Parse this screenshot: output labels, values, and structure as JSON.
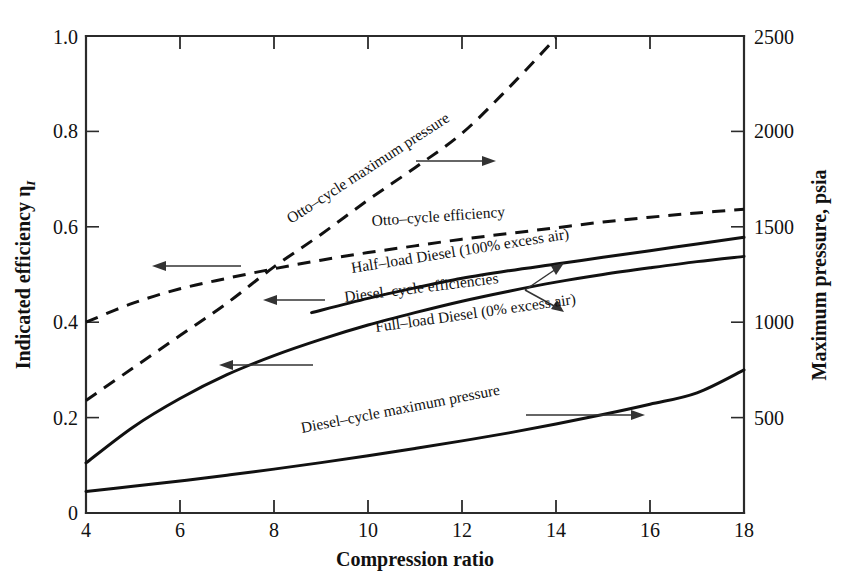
{
  "chart_data": {
    "type": "line",
    "title": "",
    "xlabel": "Compression ratio",
    "ylabel": "Indicated efficiency  η",
    "ylabel_sub": "I",
    "y2label": "Maximum pressure, psia",
    "xlim": [
      4,
      18
    ],
    "ylim": [
      0,
      1.0
    ],
    "y2lim": [
      0,
      2500
    ],
    "xticks": [
      "4",
      "6",
      "8",
      "10",
      "12",
      "14",
      "16",
      "18"
    ],
    "xtick_values": [
      4,
      6,
      8,
      10,
      12,
      14,
      16,
      18
    ],
    "yticks": [
      "0",
      "0.2",
      "0.4",
      "0.6",
      "0.8",
      "1.0"
    ],
    "ytick_values": [
      0,
      0.2,
      0.4,
      0.6,
      0.8,
      1.0
    ],
    "y2ticks": [
      "500",
      "1000",
      "1500",
      "2000",
      "2500"
    ],
    "y2tick_values": [
      500,
      1000,
      1500,
      2000,
      2500
    ],
    "grid": false,
    "legend": "inline-annotations",
    "series": [
      {
        "name": "Otto-cycle maximum pressure",
        "style": "dashed",
        "axis": "right",
        "units": "psia",
        "x": [
          4,
          5,
          6,
          7,
          8,
          9,
          10,
          11,
          12,
          13,
          14
        ],
        "values": [
          590,
          760,
          930,
          1100,
          1290,
          1460,
          1640,
          1810,
          1990,
          2230,
          2490
        ]
      },
      {
        "name": "Otto-cycle efficiency",
        "style": "dashed",
        "axis": "left",
        "units": "",
        "x": [
          4,
          5,
          6,
          7,
          8,
          9,
          10,
          11,
          12,
          13,
          14,
          15,
          16,
          17,
          18
        ],
        "values": [
          0.4,
          0.44,
          0.47,
          0.492,
          0.512,
          0.53,
          0.546,
          0.56,
          0.574,
          0.586,
          0.598,
          0.61,
          0.62,
          0.629,
          0.637
        ]
      },
      {
        "name": "Half-load Diesel (100% excess air)",
        "style": "solid",
        "axis": "left",
        "units": "",
        "x": [
          8.8,
          10,
          11,
          12,
          13,
          14,
          15,
          16,
          17,
          18
        ],
        "values": [
          0.42,
          0.45,
          0.472,
          0.492,
          0.508,
          0.522,
          0.536,
          0.55,
          0.564,
          0.578
        ]
      },
      {
        "name": "Full-load Diesel (0% excess air)",
        "style": "solid",
        "axis": "left",
        "units": "",
        "x": [
          4,
          5,
          6,
          7,
          8,
          9,
          10,
          11,
          12,
          13,
          14,
          15,
          16,
          17,
          18
        ],
        "values": [
          0.105,
          0.18,
          0.24,
          0.29,
          0.33,
          0.364,
          0.394,
          0.42,
          0.444,
          0.465,
          0.484,
          0.5,
          0.514,
          0.527,
          0.538
        ]
      },
      {
        "name": "Diesel-cycle maximum pressure",
        "style": "solid",
        "axis": "right",
        "units": "psia",
        "x": [
          4,
          5,
          6,
          7,
          8,
          9,
          10,
          11,
          12,
          13,
          14,
          15,
          16,
          17,
          18
        ],
        "values": [
          113,
          140,
          168,
          198,
          230,
          264,
          300,
          338,
          378,
          420,
          466,
          516,
          570,
          630,
          750
        ]
      }
    ],
    "annotations": [
      {
        "text": "Otto–cycle maximum pressure",
        "points_to": "right-axis"
      },
      {
        "text": "Otto–cycle efficiency",
        "points_to": "left-axis"
      },
      {
        "text": "Half–load Diesel (100% excess air)",
        "points_to": "left-axis"
      },
      {
        "text": "Diesel–cycle efficiencies",
        "points_to": "both-diesel-efficiency-curves"
      },
      {
        "text": "Full–load Diesel (0% excess air)",
        "points_to": "left-axis"
      },
      {
        "text": "Diesel–cycle maximum pressure",
        "points_to": "right-axis"
      }
    ]
  }
}
